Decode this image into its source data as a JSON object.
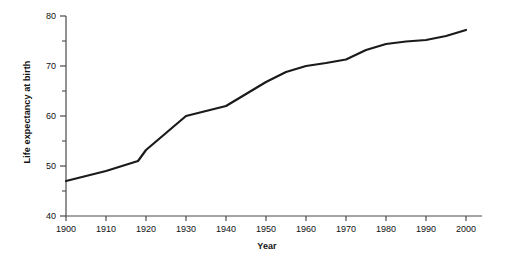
{
  "chart_data": {
    "type": "line",
    "title": "",
    "xlabel": "Year",
    "ylabel": "Life expectancy at birth",
    "xlim": [
      1900,
      2000
    ],
    "ylim": [
      40,
      80
    ],
    "grid": false,
    "legend": "none",
    "x_ticks": [
      1900,
      1910,
      1920,
      1930,
      1940,
      1950,
      1960,
      1970,
      1980,
      1990,
      2000
    ],
    "x_tick_labels": [
      "1900",
      "1910",
      "1920",
      "1930",
      "1940",
      "1950",
      "1960",
      "1970",
      "1980",
      "1990",
      "2000"
    ],
    "y_ticks": [
      40,
      50,
      60,
      70,
      80
    ],
    "y_tick_labels": [
      "40",
      "50",
      "60",
      "70",
      "80"
    ],
    "y_minor_ticks": [
      45,
      55,
      65,
      75
    ],
    "line_color": "#1a1a1a",
    "line_width": 2.2,
    "axis_color": "#4a4a4a",
    "background": "#ffffff",
    "series": [
      {
        "name": "Life expectancy at birth",
        "x": [
          1900,
          1910,
          1918,
          1920,
          1930,
          1940,
          1950,
          1955,
          1960,
          1965,
          1970,
          1975,
          1980,
          1985,
          1990,
          1995,
          2000
        ],
        "values": [
          47.0,
          49.0,
          51.0,
          53.2,
          60.0,
          62.0,
          66.8,
          68.8,
          70.0,
          70.6,
          71.3,
          73.2,
          74.4,
          74.9,
          75.2,
          76.0,
          77.2
        ]
      }
    ]
  }
}
